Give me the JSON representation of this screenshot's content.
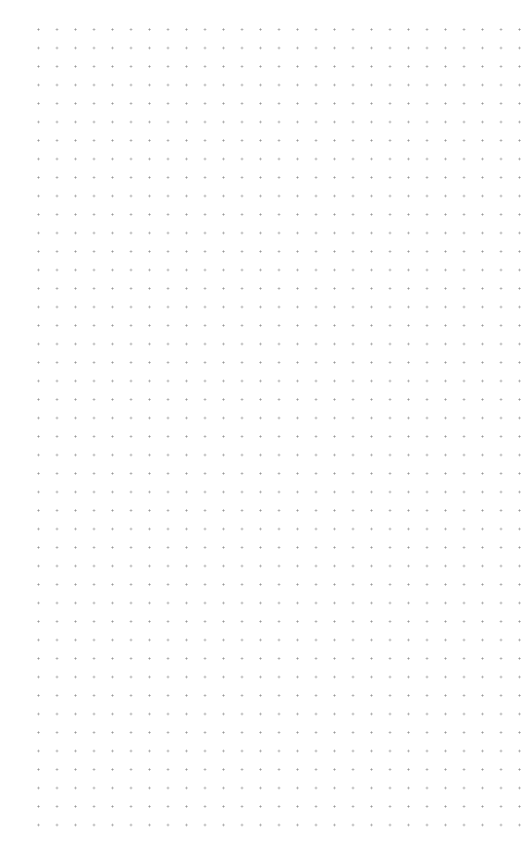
{
  "canvas": {
    "type": "dot-grid",
    "background_color": "#ffffff",
    "dot_color": "#9a9a9a",
    "dot_spacing_px": 18.5,
    "columns": 27,
    "rows": 44
  }
}
